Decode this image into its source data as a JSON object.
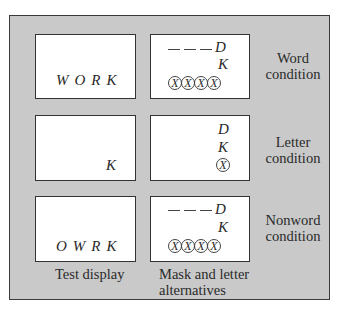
{
  "rows": [
    {
      "condition_label_line1": "Word",
      "condition_label_line2": "condition",
      "test_display": "WORK",
      "mask": {
        "alternative_top": "D",
        "alternative_bottom": "K",
        "mask_count": 4,
        "mask_glyph": "X",
        "dashes": true
      }
    },
    {
      "condition_label_line1": "Letter",
      "condition_label_line2": "condition",
      "test_display": "K",
      "mask": {
        "alternative_top": "D",
        "alternative_bottom": "K",
        "mask_count": 1,
        "mask_glyph": "X",
        "dashes": false
      }
    },
    {
      "condition_label_line1": "Nonword",
      "condition_label_line2": "condition",
      "test_display": "OWRK",
      "mask": {
        "alternative_top": "D",
        "alternative_bottom": "K",
        "mask_count": 4,
        "mask_glyph": "X",
        "dashes": true
      }
    }
  ],
  "captions": {
    "test_display": "Test display",
    "mask_line1": "Mask and letter",
    "mask_line2": "alternatives"
  },
  "colors": {
    "panel": "#c9c9c9",
    "box": "#ffffff",
    "border": "#333333"
  }
}
